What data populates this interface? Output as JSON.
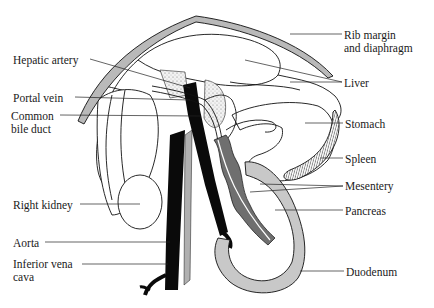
{
  "figure": {
    "colors": {
      "background": "#ffffff",
      "ink": "#111111",
      "rib_fill": "#b9b9b9",
      "pancreas_fill": "#6f6f6f",
      "vessel_fill": "#0a0a0a",
      "stipple_fill": "#e3e3e3"
    },
    "labels_left": [
      {
        "id": "hepatic-artery",
        "text": "Hepatic artery",
        "x": 13,
        "y": 54
      },
      {
        "id": "portal-vein",
        "text": "Portal vein",
        "x": 13,
        "y": 92
      },
      {
        "id": "common-bile-duct-1",
        "text": "Common",
        "x": 11,
        "y": 111
      },
      {
        "id": "common-bile-duct-2",
        "text": "bile duct",
        "x": 11,
        "y": 124
      },
      {
        "id": "right-kidney",
        "text": "Right kidney",
        "x": 13,
        "y": 199
      },
      {
        "id": "aorta",
        "text": "Aorta",
        "x": 13,
        "y": 237
      },
      {
        "id": "inferior-vena-cava-1",
        "text": "Inferior vena",
        "x": 13,
        "y": 258
      },
      {
        "id": "inferior-vena-cava-2",
        "text": "cava",
        "x": 13,
        "y": 271
      }
    ],
    "labels_right": [
      {
        "id": "rib-margin-1",
        "text": "Rib margin",
        "x": 344,
        "y": 29
      },
      {
        "id": "rib-margin-2",
        "text": "and diaphragm",
        "x": 344,
        "y": 42
      },
      {
        "id": "liver",
        "text": "Liver",
        "x": 344,
        "y": 78
      },
      {
        "id": "stomach",
        "text": "Stomach",
        "x": 345,
        "y": 118
      },
      {
        "id": "spleen",
        "text": "Spleen",
        "x": 345,
        "y": 153
      },
      {
        "id": "mesentery",
        "text": "Mesentery",
        "x": 345,
        "y": 180
      },
      {
        "id": "pancreas",
        "text": "Pancreas",
        "x": 345,
        "y": 205
      },
      {
        "id": "duodenum",
        "text": "Duodenum",
        "x": 346,
        "y": 266
      }
    ]
  }
}
